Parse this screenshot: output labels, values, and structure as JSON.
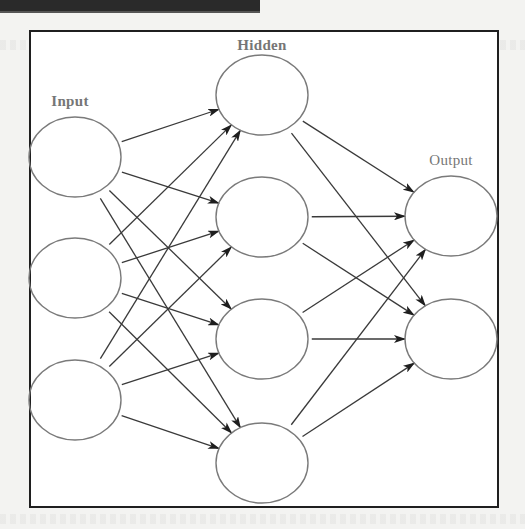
{
  "diagram": {
    "type": "neural-network",
    "layers": [
      {
        "name": "input",
        "label": "Input",
        "label_pos": [
          70,
          101
        ],
        "nodes": [
          [
            75,
            157
          ],
          [
            75,
            278
          ],
          [
            75,
            400
          ]
        ]
      },
      {
        "name": "hidden",
        "label": "Hidden",
        "label_pos": [
          262,
          45
        ],
        "nodes": [
          [
            262,
            95
          ],
          [
            262,
            217
          ],
          [
            262,
            339
          ],
          [
            262,
            463
          ]
        ]
      },
      {
        "name": "output",
        "label": "Output",
        "label_pos": [
          451,
          160
        ],
        "nodes": [
          [
            451,
            216
          ],
          [
            451,
            339
          ]
        ]
      }
    ],
    "node_rx": 46,
    "node_ry": 40,
    "connectivity": "fully-connected",
    "colors": {
      "node_stroke": "#7a7a7a",
      "edge": "#3a3a3a",
      "arrowhead": "#1e1e1e",
      "label": "#767676",
      "frame": "#1f1f1f"
    }
  }
}
